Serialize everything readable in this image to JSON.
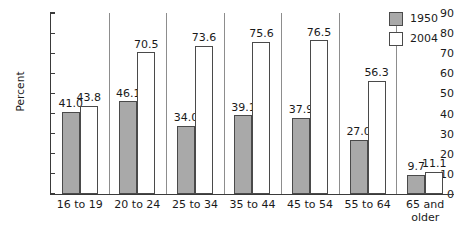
{
  "chart_data": {
    "type": "bar",
    "title": "",
    "subtitle": "",
    "xlabel": "",
    "ylabel": "Percent",
    "ylim": [
      0,
      90
    ],
    "yticks": [
      0,
      10,
      20,
      30,
      40,
      50,
      60,
      70,
      80,
      90
    ],
    "ytick_labels": [
      "0",
      "10",
      "20",
      "30",
      "40",
      "50",
      "60",
      "70",
      "80",
      "90"
    ],
    "grid": false,
    "legend_position": "top-right",
    "categories": [
      "16 to 19",
      "20 to 24",
      "25 to 34",
      "35 to 44",
      "45 to 54",
      "55 to 64",
      "65 and\nolder"
    ],
    "series": [
      {
        "name": "1950",
        "color": "#a9a9a9",
        "values": [
          41.0,
          46.1,
          34.0,
          39.1,
          37.9,
          27.0,
          9.7
        ],
        "data_labels": [
          "41.0",
          "46.1",
          "34.0",
          "39.1",
          "37.9",
          "27.0",
          "9.7"
        ]
      },
      {
        "name": "2004",
        "color": "#ffffff",
        "values": [
          43.8,
          70.5,
          73.6,
          75.6,
          76.5,
          56.3,
          11.1
        ],
        "data_labels": [
          "43.8",
          "70.5",
          "73.6",
          "75.6",
          "76.5",
          "56.3",
          "11.1"
        ]
      }
    ]
  },
  "legend": {
    "entries": [
      {
        "label": "1950",
        "swatch": "gray-filled-swatch"
      },
      {
        "label": "2004",
        "swatch": "white-outlined-swatch"
      }
    ]
  },
  "axes": {
    "y_title": "Percent"
  },
  "colors": {
    "series_1950": "#a9a9a9",
    "series_2004": "#ffffff",
    "axis": "#3a3a3a",
    "bar_outline": "#4a4a4a",
    "separator": "#8d8d8d",
    "text": "#1a1a1a",
    "background": "#ffffff"
  }
}
